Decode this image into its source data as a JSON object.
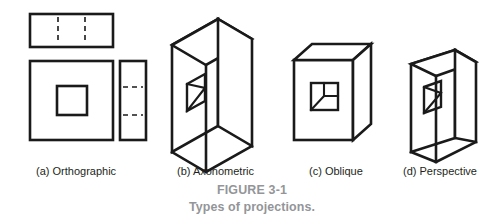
{
  "figure": {
    "caption_title": "FIGURE 3-1",
    "caption_subtitle": "Types of projections.",
    "caption_color": "#939598",
    "ink_color": "#1a1a1a",
    "background_color": "#ffffff"
  },
  "panels": [
    {
      "key": "orthographic",
      "label": "(a) Orthographic",
      "description": "Multiview drawing: top view rectangle with two vertical hidden lines, front view square with square hole, right side view narrow rectangle with two horizontal hidden lines"
    },
    {
      "key": "axonometric",
      "label": "(b) Axonometric",
      "description": "Isometric pictorial of a rectangular block with a square through-hole, parallel receding edges"
    },
    {
      "key": "oblique",
      "label": "(c) Oblique",
      "description": "Cube pictorial with true-shape front face containing a square hole and receding depth lines at an angle"
    },
    {
      "key": "perspective",
      "label": "(d) Perspective",
      "description": "Block pictorial with converging receding edges and a square through-hole in the front face"
    }
  ]
}
